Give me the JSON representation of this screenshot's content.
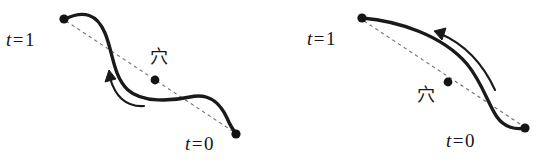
{
  "figure": {
    "background_color": "#ffffff",
    "stroke_color": "#1a1a1a",
    "dash_color": "#6b6b6b",
    "panels": [
      {
        "id": "left-panel",
        "name": "s-shaped-curve-panel",
        "description": "S-shaped curve from t=1 endpoint down to t=0 endpoint with dashed chord and interior hole point",
        "labels": {
          "t1": {
            "var": "t",
            "op": "=",
            "value": "1"
          },
          "t0": {
            "var": "t",
            "op": "=",
            "value": "0"
          },
          "hole": "穴"
        },
        "points": {
          "t1": [
            64,
            19
          ],
          "t0": [
            236,
            134
          ],
          "hole": [
            155,
            80
          ]
        },
        "arrow_direction": "counterclockwise-toward-t1"
      },
      {
        "id": "right-panel",
        "name": "bowed-curve-panel",
        "description": "Bowed curve from t=1 endpoint arcing right and down to t=0 endpoint with dashed chord and hole point below the chord",
        "labels": {
          "t1": {
            "var": "t",
            "op": "=",
            "value": "1"
          },
          "t0": {
            "var": "t",
            "op": "=",
            "value": "0"
          },
          "hole": "穴"
        },
        "points": {
          "t1": [
            362,
            18
          ],
          "t0": [
            525,
            128
          ],
          "hole": [
            448,
            82
          ]
        },
        "arrow_direction": "counterclockwise-toward-t1"
      }
    ]
  }
}
